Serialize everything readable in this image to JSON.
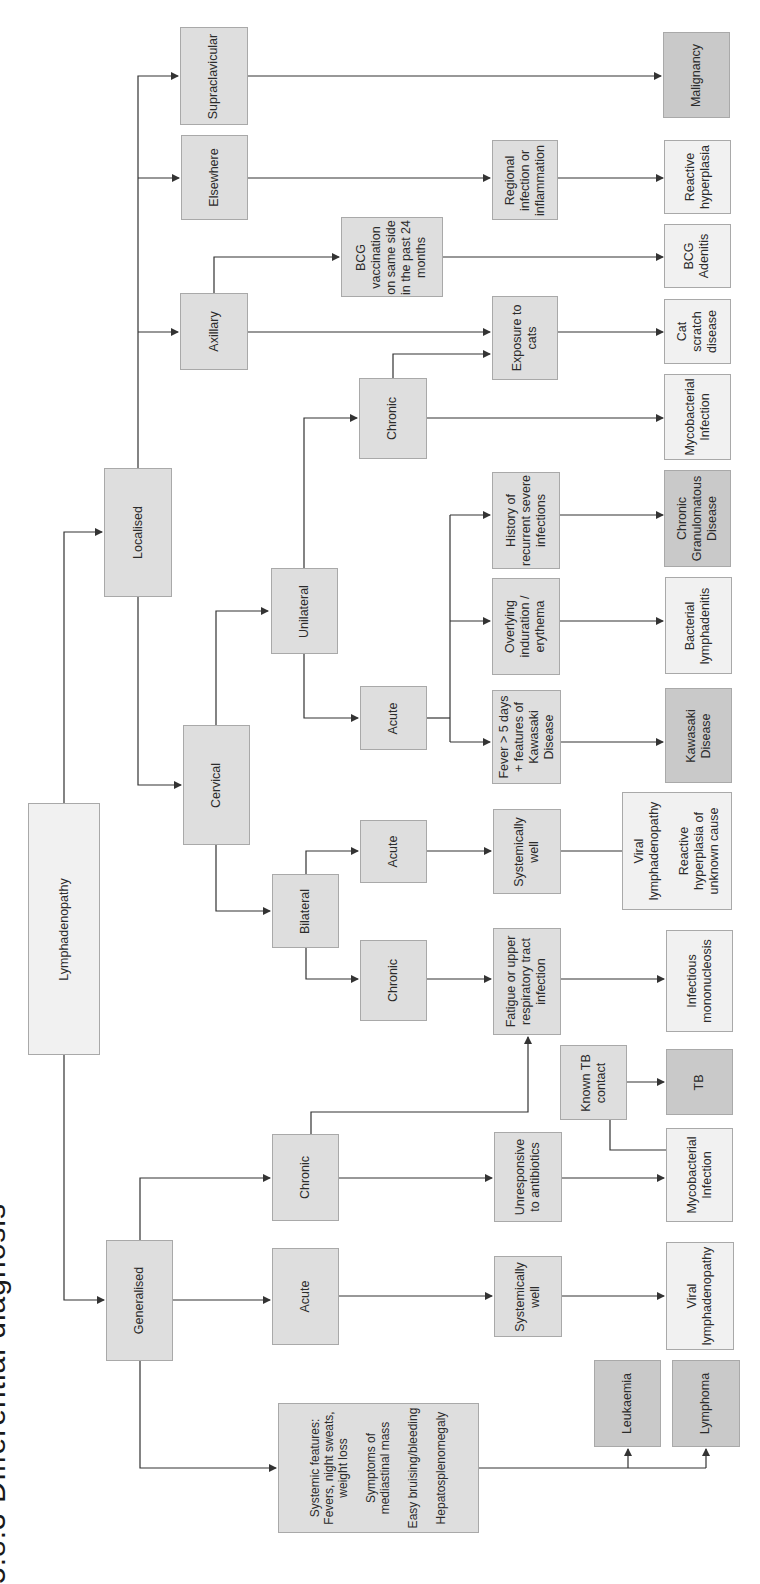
{
  "title": "5.8.3 Differential diagnosis",
  "orientation": "rotated 90 degrees counter-clockwise",
  "colors": {
    "light_box": "#f1f1f1",
    "mid_box": "#dedede",
    "dark_box": "#c9c9c9",
    "line": "#333333"
  },
  "nodes": {
    "root": "Lymphadenopathy",
    "localised": "Localised",
    "generalised": "Generalised",
    "supraclavicular": "Supraclavicular",
    "elsewhere": "Elsewhere",
    "axillary": "Axillary",
    "cervical": "Cervical",
    "unilateral": "Unilateral",
    "bilateral": "Bilateral",
    "bcg_vaccination": "BCG\nvaccination\non same side\nin the past 24\nmonths",
    "regional_infection": "Regional\ninfection or\ninflammation",
    "chronic_unilateral": "Chronic",
    "acute_unilateral": "Acute",
    "exposure_cats": "Exposure to\ncats",
    "history_recurrent": "History of\nrecurrent severe\ninfections",
    "overlying_induration": "Overlying\ninduration /\nerythema",
    "fever_kawasaki": "Fever > 5 days\n+ features of\nKawasaki\nDisease",
    "acute_bilateral": "Acute",
    "chronic_bilateral": "Chronic",
    "systemically_well_bilateral": "Systemically\nwell",
    "fatigue_urti": "Fatigue or upper\nrespiratory tract\ninfection",
    "known_tb_contact": "Known TB\ncontact",
    "acute_generalised": "Acute",
    "chronic_generalised": "Chronic",
    "systemically_well_generalised": "Systemically\nwell",
    "unresponsive_antibiotics": "Unresponsive\nto antibiotics",
    "systemic_features": "Systemic features:\nFevers, night sweats,\nweight loss\n\nSymptoms of\nmediastinal mass\n\nEasy bruising/bleeding\n\nHepatosplenomegaly",
    "malignancy": "Malignancy",
    "reactive_hyperplasia": "Reactive\nhyperplasia",
    "bcg_adenitis": "BCG\nAdenitis",
    "cat_scratch": "Cat\nscratch\ndisease",
    "mycobacterial_unilateral": "Mycobacterial\nInfection",
    "chronic_granulomatous": "Chronic\nGranulomatous\nDisease",
    "bacterial_lymphadenitis": "Bacterial\nlymphadenitis",
    "kawasaki": "Kawasaki\nDisease",
    "viral_reactive_bilateral": "Viral\nlymphadenopathy\n\nReactive\nhyperplasia of\nunknown cause",
    "infectious_mono": "Infectious\nmononucleosis",
    "tb": "TB",
    "mycobacterial_generalised": "Mycobacterial\nInfection",
    "viral_generalised": "Viral\nlymphadenopathy",
    "leukaemia": "Leukaemia",
    "lymphoma": "Lymphoma"
  }
}
